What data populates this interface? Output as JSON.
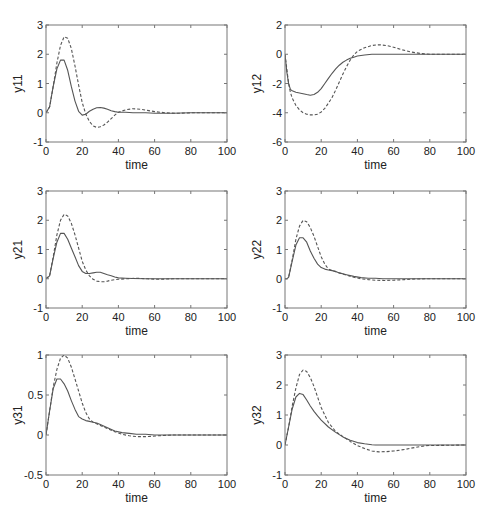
{
  "figure": {
    "width": 490,
    "height": 518,
    "line_color": "#555555",
    "axes_color": "#777777"
  },
  "chart_data": [
    {
      "type": "line",
      "ylabel": "y11",
      "xlabel": "time",
      "xlim": [
        0,
        100
      ],
      "ylim": [
        -1,
        3
      ],
      "xticks": [
        0,
        20,
        40,
        60,
        80,
        100
      ],
      "yticks": [
        -1,
        0,
        1,
        2,
        3
      ],
      "grid": false,
      "box": {
        "left": 46,
        "top": 25,
        "right": 227,
        "bottom": 142
      },
      "series": [
        {
          "name": "solid",
          "style": "solid",
          "x": [
            0,
            2,
            4,
            6,
            8,
            10,
            12,
            14,
            16,
            18,
            20,
            22,
            24,
            26,
            28,
            30,
            32,
            34,
            36,
            38,
            40,
            44,
            48,
            55,
            60,
            70,
            80,
            100
          ],
          "y": [
            0,
            0.2,
            0.9,
            1.5,
            1.8,
            1.8,
            1.45,
            0.9,
            0.4,
            0.05,
            -0.08,
            -0.05,
            0.05,
            0.12,
            0.17,
            0.18,
            0.16,
            0.12,
            0.07,
            0.04,
            0.02,
            0.02,
            0.0,
            0.0,
            -0.02,
            -0.02,
            0,
            0
          ]
        },
        {
          "name": "dashed",
          "style": "dashed",
          "x": [
            0,
            2,
            4,
            6,
            8,
            10,
            12,
            14,
            16,
            18,
            20,
            22,
            24,
            26,
            28,
            30,
            32,
            34,
            36,
            38,
            40,
            44,
            48,
            52,
            56,
            60,
            66,
            72,
            80,
            100
          ],
          "y": [
            0,
            0.2,
            0.9,
            1.7,
            2.3,
            2.6,
            2.55,
            2.2,
            1.6,
            0.95,
            0.35,
            -0.05,
            -0.3,
            -0.45,
            -0.5,
            -0.48,
            -0.42,
            -0.32,
            -0.2,
            -0.08,
            0.02,
            0.1,
            0.14,
            0.12,
            0.08,
            0.04,
            0.0,
            -0.02,
            0,
            0
          ]
        }
      ]
    },
    {
      "type": "line",
      "ylabel": "y12",
      "xlabel": "time",
      "xlim": [
        0,
        100
      ],
      "ylim": [
        -6,
        2
      ],
      "xticks": [
        0,
        20,
        40,
        60,
        80,
        100
      ],
      "yticks": [
        -6,
        -4,
        -2,
        0,
        2
      ],
      "grid": false,
      "box": {
        "left": 285,
        "top": 25,
        "right": 466,
        "bottom": 142
      },
      "series": [
        {
          "name": "solid",
          "style": "solid",
          "x": [
            0,
            1,
            2,
            3,
            4,
            6,
            8,
            10,
            12,
            14,
            16,
            18,
            20,
            22,
            24,
            26,
            28,
            30,
            32,
            34,
            36,
            38,
            40,
            44,
            48,
            55,
            70,
            100
          ],
          "y": [
            0,
            -1.2,
            -2.0,
            -2.4,
            -2.5,
            -2.6,
            -2.65,
            -2.7,
            -2.75,
            -2.8,
            -2.75,
            -2.6,
            -2.35,
            -2.0,
            -1.65,
            -1.3,
            -1.0,
            -0.75,
            -0.55,
            -0.4,
            -0.28,
            -0.2,
            -0.12,
            -0.05,
            0.0,
            0.0,
            0,
            0
          ]
        },
        {
          "name": "dashed",
          "style": "dashed",
          "x": [
            0,
            1,
            2,
            3,
            4,
            6,
            8,
            10,
            12,
            14,
            16,
            18,
            20,
            22,
            24,
            26,
            28,
            30,
            32,
            34,
            36,
            38,
            40,
            44,
            48,
            52,
            56,
            60,
            65,
            70,
            75,
            80,
            100
          ],
          "y": [
            0,
            -1.0,
            -2.0,
            -2.6,
            -3.0,
            -3.5,
            -3.8,
            -4.0,
            -4.1,
            -4.15,
            -4.15,
            -4.1,
            -3.95,
            -3.7,
            -3.35,
            -2.95,
            -2.45,
            -1.9,
            -1.35,
            -0.85,
            -0.4,
            -0.05,
            0.2,
            0.45,
            0.6,
            0.65,
            0.6,
            0.48,
            0.3,
            0.15,
            0.05,
            0.0,
            0
          ]
        }
      ]
    },
    {
      "type": "line",
      "ylabel": "y21",
      "xlabel": "time",
      "xlim": [
        0,
        100
      ],
      "ylim": [
        -1,
        3
      ],
      "xticks": [
        0,
        20,
        40,
        60,
        80,
        100
      ],
      "yticks": [
        -1,
        0,
        1,
        2,
        3
      ],
      "grid": false,
      "box": {
        "left": 46,
        "top": 191,
        "right": 227,
        "bottom": 308
      },
      "series": [
        {
          "name": "solid",
          "style": "solid",
          "x": [
            0,
            2,
            4,
            6,
            8,
            10,
            12,
            14,
            16,
            18,
            20,
            22,
            24,
            26,
            28,
            30,
            32,
            34,
            36,
            38,
            40,
            44,
            48,
            55,
            60,
            100
          ],
          "y": [
            0,
            0.1,
            0.7,
            1.25,
            1.55,
            1.55,
            1.35,
            1.05,
            0.75,
            0.45,
            0.25,
            0.18,
            0.18,
            0.2,
            0.22,
            0.22,
            0.18,
            0.14,
            0.1,
            0.06,
            0.03,
            0.02,
            0.01,
            0.0,
            0,
            0
          ]
        },
        {
          "name": "dashed",
          "style": "dashed",
          "x": [
            0,
            2,
            4,
            6,
            8,
            10,
            12,
            14,
            16,
            18,
            20,
            22,
            24,
            26,
            28,
            30,
            32,
            34,
            36,
            40,
            44,
            50,
            56,
            62,
            70,
            100
          ],
          "y": [
            0,
            0.1,
            0.75,
            1.5,
            2.0,
            2.2,
            2.15,
            1.9,
            1.5,
            1.05,
            0.6,
            0.3,
            0.1,
            -0.02,
            -0.08,
            -0.1,
            -0.1,
            -0.08,
            -0.05,
            -0.02,
            0.0,
            0.02,
            0.0,
            -0.02,
            0,
            0
          ]
        }
      ]
    },
    {
      "type": "line",
      "ylabel": "y22",
      "xlabel": "time",
      "xlim": [
        0,
        100
      ],
      "ylim": [
        -1,
        3
      ],
      "xticks": [
        0,
        20,
        40,
        60,
        80,
        100
      ],
      "yticks": [
        -1,
        0,
        1,
        2,
        3
      ],
      "grid": false,
      "box": {
        "left": 285,
        "top": 191,
        "right": 466,
        "bottom": 308
      },
      "series": [
        {
          "name": "solid",
          "style": "solid",
          "x": [
            0,
            1,
            2,
            4,
            6,
            8,
            10,
            12,
            14,
            16,
            18,
            20,
            22,
            24,
            26,
            28,
            30,
            34,
            38,
            42,
            46,
            50,
            54,
            60,
            100
          ],
          "y": [
            0,
            0,
            0.05,
            0.6,
            1.15,
            1.4,
            1.4,
            1.25,
            0.95,
            0.7,
            0.5,
            0.38,
            0.33,
            0.3,
            0.28,
            0.25,
            0.2,
            0.14,
            0.08,
            0.04,
            0.02,
            0.02,
            0.0,
            0,
            0
          ]
        },
        {
          "name": "dashed",
          "style": "dashed",
          "x": [
            0,
            1,
            2,
            4,
            6,
            8,
            10,
            12,
            14,
            16,
            18,
            20,
            22,
            24,
            26,
            28,
            30,
            34,
            38,
            42,
            46,
            50,
            55,
            60,
            66,
            72,
            78,
            100
          ],
          "y": [
            0,
            0,
            0.05,
            0.65,
            1.35,
            1.8,
            2.0,
            1.95,
            1.75,
            1.45,
            1.1,
            0.75,
            0.5,
            0.33,
            0.28,
            0.24,
            0.2,
            0.12,
            0.05,
            0.0,
            -0.03,
            -0.05,
            -0.06,
            -0.05,
            -0.03,
            -0.01,
            0,
            0
          ]
        }
      ]
    },
    {
      "type": "line",
      "ylabel": "y31",
      "xlabel": "time",
      "xlim": [
        0,
        100
      ],
      "ylim": [
        -0.5,
        1
      ],
      "xticks": [
        0,
        20,
        40,
        60,
        80,
        100
      ],
      "yticks": [
        -0.5,
        0,
        0.5,
        1
      ],
      "grid": false,
      "box": {
        "left": 46,
        "top": 355,
        "right": 227,
        "bottom": 475
      },
      "series": [
        {
          "name": "solid",
          "style": "solid",
          "x": [
            0,
            2,
            4,
            6,
            8,
            10,
            12,
            14,
            16,
            18,
            20,
            22,
            24,
            26,
            28,
            30,
            34,
            38,
            42,
            46,
            50,
            55,
            60,
            100
          ],
          "y": [
            0,
            0.3,
            0.58,
            0.7,
            0.7,
            0.64,
            0.55,
            0.43,
            0.32,
            0.23,
            0.2,
            0.18,
            0.17,
            0.16,
            0.15,
            0.13,
            0.09,
            0.05,
            0.03,
            0.02,
            0.01,
            0.01,
            0.0,
            0
          ]
        },
        {
          "name": "dashed",
          "style": "dashed",
          "x": [
            0,
            2,
            4,
            6,
            8,
            10,
            12,
            14,
            16,
            18,
            20,
            22,
            24,
            26,
            28,
            30,
            34,
            38,
            42,
            46,
            50,
            56,
            62,
            70,
            80,
            100
          ],
          "y": [
            0,
            0.3,
            0.6,
            0.82,
            0.96,
            1.0,
            0.96,
            0.85,
            0.7,
            0.55,
            0.4,
            0.28,
            0.2,
            0.16,
            0.14,
            0.12,
            0.08,
            0.04,
            0.01,
            -0.01,
            -0.02,
            -0.02,
            -0.01,
            0.0,
            0,
            0
          ]
        }
      ]
    },
    {
      "type": "line",
      "ylabel": "y32",
      "xlabel": "time",
      "xlim": [
        0,
        100
      ],
      "ylim": [
        -1,
        3
      ],
      "xticks": [
        0,
        20,
        40,
        60,
        80,
        100
      ],
      "yticks": [
        -1,
        0,
        1,
        2,
        3
      ],
      "grid": false,
      "box": {
        "left": 285,
        "top": 355,
        "right": 466,
        "bottom": 475
      },
      "series": [
        {
          "name": "solid",
          "style": "solid",
          "x": [
            0,
            1,
            2,
            4,
            6,
            8,
            10,
            12,
            14,
            16,
            18,
            20,
            24,
            28,
            32,
            36,
            40,
            44,
            48,
            50,
            60,
            100
          ],
          "y": [
            0,
            0.3,
            0.6,
            1.2,
            1.6,
            1.72,
            1.68,
            1.5,
            1.3,
            1.12,
            0.97,
            0.83,
            0.6,
            0.42,
            0.27,
            0.16,
            0.08,
            0.04,
            0.01,
            0.0,
            0,
            0
          ]
        },
        {
          "name": "dashed",
          "style": "dashed",
          "x": [
            0,
            1,
            2,
            4,
            6,
            8,
            10,
            12,
            14,
            16,
            18,
            20,
            24,
            28,
            32,
            36,
            40,
            44,
            48,
            52,
            56,
            60,
            66,
            72,
            78,
            100
          ],
          "y": [
            0,
            0.3,
            0.6,
            1.3,
            1.9,
            2.35,
            2.5,
            2.45,
            2.25,
            1.95,
            1.6,
            1.25,
            0.75,
            0.45,
            0.28,
            0.12,
            -0.02,
            -0.12,
            -0.2,
            -0.23,
            -0.22,
            -0.2,
            -0.15,
            -0.08,
            -0.02,
            0
          ]
        }
      ]
    }
  ]
}
